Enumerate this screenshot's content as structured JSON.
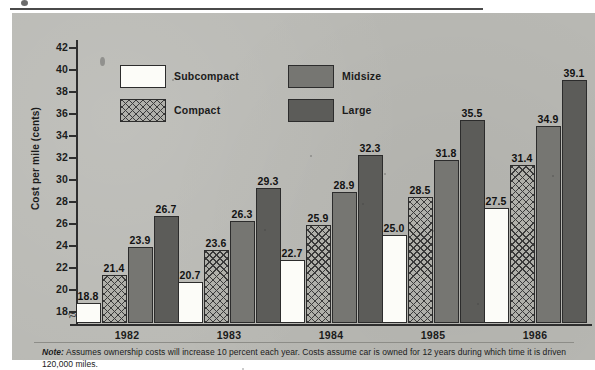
{
  "figure": {
    "y_axis_title": "Cost per mile (cents)",
    "axis_break_glyph": "≈",
    "footnote_lead": "Note:",
    "footnote_text": " Assumes ownership costs will increase 10 percent each year. Costs assume car is owned for 12 years during which time it is driven 120,000 miles."
  },
  "legend": {
    "entries": [
      {
        "label": "Subcompact",
        "swatch": "white-solid",
        "color": "#fcfcf8"
      },
      {
        "label": "Compact",
        "swatch": "crosshatch",
        "color": "#b0b0aa"
      },
      {
        "label": "Midsize",
        "swatch": "medium-gray",
        "color": "#767672"
      },
      {
        "label": "Large",
        "swatch": "dark-gray",
        "color": "#5c5c59"
      }
    ]
  },
  "chart_data": {
    "type": "bar",
    "title": "",
    "subtitle": "",
    "xlabel": "",
    "ylabel": "Cost per mile (cents)",
    "categories": [
      "1982",
      "1983",
      "1984",
      "1985",
      "1986"
    ],
    "series": [
      {
        "name": "Subcompact",
        "color": "#fcfcf8",
        "values": [
          18.8,
          20.7,
          22.7,
          25.0,
          27.5
        ]
      },
      {
        "name": "Compact",
        "color": "#b0b0aa",
        "values": [
          21.4,
          23.6,
          25.9,
          28.5,
          31.4
        ]
      },
      {
        "name": "Midsize",
        "color": "#767672",
        "values": [
          23.9,
          26.3,
          28.9,
          31.8,
          34.9
        ]
      },
      {
        "name": "Large",
        "color": "#5c5c59",
        "values": [
          26.7,
          29.3,
          32.3,
          35.5,
          39.1
        ]
      }
    ],
    "ylim": [
      17,
      43
    ],
    "yticks": [
      18,
      20,
      22,
      24,
      26,
      28,
      30,
      32,
      34,
      36,
      38,
      40,
      42
    ],
    "ytick_labels": [
      "18",
      "20",
      "22",
      "24",
      "26",
      "28",
      "30",
      "32",
      "34",
      "36",
      "38",
      "40",
      "42"
    ],
    "axis_break": true,
    "grid": false,
    "legend_position": "upper-left-inside",
    "bar_labels": true,
    "annotations": [
      "Note: Assumes ownership costs will increase 10 percent each year. Costs assume car is owned for 12 years during which time it is driven 120,000 miles."
    ]
  }
}
